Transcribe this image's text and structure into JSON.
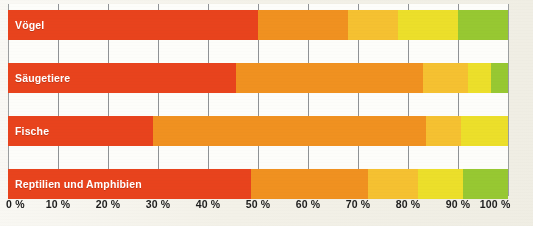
{
  "chart_data": {
    "type": "bar",
    "orientation": "horizontal",
    "stacked": true,
    "title": "",
    "subtitle": "",
    "xlabel": "",
    "ylabel": "",
    "xlim": [
      0,
      100
    ],
    "grid": true,
    "legend_position": "none",
    "axis_unit": "%",
    "tick_labels": [
      "0 %",
      "10 %",
      "20 %",
      "30 %",
      "40 %",
      "50 %",
      "60 %",
      "70 %",
      "80 %",
      "90 %",
      "100 %"
    ],
    "tick_values": [
      0,
      10,
      20,
      30,
      40,
      50,
      60,
      70,
      80,
      90,
      100
    ],
    "categories": [
      "Vögel",
      "Säugetiere",
      "Fische",
      "Reptilien und Amphibien"
    ],
    "series": [
      {
        "name": "red",
        "color": "#e8431d",
        "values": [
          50.0,
          45.5,
          29.0,
          48.5
        ]
      },
      {
        "name": "orange",
        "color": "#f09120",
        "values": [
          18.0,
          37.5,
          54.5,
          23.5
        ]
      },
      {
        "name": "yellow-orange",
        "color": "#f5c131",
        "values": [
          12.0,
          9.0,
          7.0,
          10.0
        ]
      },
      {
        "name": "yellow",
        "color": "#ecdf2a",
        "values": [
          10.0,
          4.5,
          9.5,
          9.0
        ]
      },
      {
        "name": "green",
        "color": "#97c832",
        "values": [
          10.0,
          3.5,
          0.0,
          9.0
        ]
      }
    ],
    "bars": [
      {
        "label": "Vögel",
        "segments": [
          {
            "series": "red",
            "start": 0.0,
            "end": 50.0,
            "value": 50.0,
            "color": "#e8431d"
          },
          {
            "series": "orange",
            "start": 50.0,
            "end": 68.0,
            "value": 18.0,
            "color": "#f09120"
          },
          {
            "series": "yellow-orange",
            "start": 68.0,
            "end": 78.0,
            "value": 10.0,
            "color": "#f5c131"
          },
          {
            "series": "yellow",
            "start": 78.0,
            "end": 90.0,
            "value": 12.0,
            "color": "#ecdf2a"
          },
          {
            "series": "green",
            "start": 90.0,
            "end": 100.0,
            "value": 10.0,
            "color": "#97c832"
          }
        ]
      },
      {
        "label": "Säugetiere",
        "segments": [
          {
            "series": "red",
            "start": 0.0,
            "end": 45.5,
            "value": 45.5,
            "color": "#e8431d"
          },
          {
            "series": "orange",
            "start": 45.5,
            "end": 83.0,
            "value": 37.5,
            "color": "#f09120"
          },
          {
            "series": "yellow-orange",
            "start": 83.0,
            "end": 92.0,
            "value": 9.0,
            "color": "#f5c131"
          },
          {
            "series": "yellow",
            "start": 92.0,
            "end": 96.5,
            "value": 4.5,
            "color": "#ecdf2a"
          },
          {
            "series": "green",
            "start": 96.5,
            "end": 100.0,
            "value": 3.5,
            "color": "#97c832"
          }
        ]
      },
      {
        "label": "Fische",
        "segments": [
          {
            "series": "red",
            "start": 0.0,
            "end": 29.0,
            "value": 29.0,
            "color": "#e8431d"
          },
          {
            "series": "orange",
            "start": 29.0,
            "end": 83.5,
            "value": 54.5,
            "color": "#f09120"
          },
          {
            "series": "yellow-orange",
            "start": 83.5,
            "end": 90.5,
            "value": 7.0,
            "color": "#f5c131"
          },
          {
            "series": "yellow",
            "start": 90.5,
            "end": 100.0,
            "value": 9.5,
            "color": "#ecdf2a"
          }
        ]
      },
      {
        "label": "Reptilien und Amphibien",
        "segments": [
          {
            "series": "red",
            "start": 0.0,
            "end": 48.5,
            "value": 48.5,
            "color": "#e8431d"
          },
          {
            "series": "orange",
            "start": 48.5,
            "end": 72.0,
            "value": 23.5,
            "color": "#f09120"
          },
          {
            "series": "yellow-orange",
            "start": 72.0,
            "end": 82.0,
            "value": 10.0,
            "color": "#f5c131"
          },
          {
            "series": "yellow",
            "start": 82.0,
            "end": 91.0,
            "value": 9.0,
            "color": "#ecdf2a"
          },
          {
            "series": "green",
            "start": 91.0,
            "end": 100.0,
            "value": 9.0,
            "color": "#97c832"
          }
        ]
      }
    ]
  },
  "colors": {
    "red": "#e8431d",
    "orange": "#f09120",
    "yellow_orange": "#f5c131",
    "yellow": "#ecdf2a",
    "green": "#97c832",
    "gridline": "#8f9295",
    "plot_background": "#fdfdfa",
    "page_background": "#f3f1e8",
    "label_text": "#ffffff",
    "tick_text": "#1c1c1c"
  }
}
